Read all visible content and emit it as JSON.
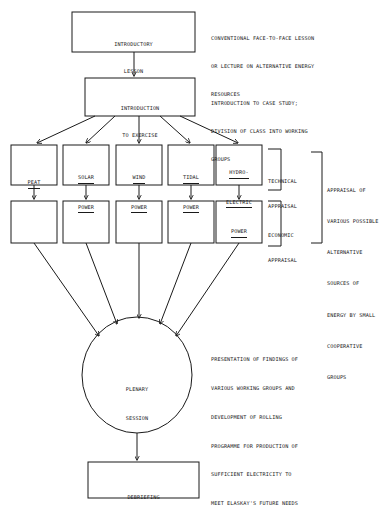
{
  "diagram": {
    "stroke_color": "#1a1a1a",
    "background_color": "#ffffff"
  },
  "nodes": {
    "introductory_lesson": {
      "shape": "rectangle",
      "lines": [
        "INTRODUCTORY",
        "LESSON"
      ]
    },
    "introduction_to_exercise": {
      "shape": "rectangle",
      "lines": [
        "INTRODUCTION",
        "TO EXERCISE"
      ]
    },
    "plenary_session": {
      "shape": "ellipse",
      "lines": [
        "PLENARY",
        "SESSION"
      ]
    },
    "debriefing": {
      "shape": "rectangle",
      "lines": [
        "DEBRIEFING"
      ]
    }
  },
  "technical_row": {
    "underlined": true,
    "boxes": [
      {
        "id": "peat",
        "lines": [
          "PEAT"
        ]
      },
      {
        "id": "solar-power",
        "lines": [
          "SOLAR",
          "POWER"
        ]
      },
      {
        "id": "wind-power",
        "lines": [
          "WIND",
          "POWER"
        ]
      },
      {
        "id": "tidal-power",
        "lines": [
          "TIDAL",
          "POWER"
        ]
      },
      {
        "id": "hydro-electric-power",
        "lines": [
          "HYDRO-",
          "ELECTRIC",
          "POWER"
        ]
      }
    ]
  },
  "economic_row": {
    "boxes": [
      {
        "id": "peat-economic",
        "lines": []
      },
      {
        "id": "solar-power-economic",
        "lines": []
      },
      {
        "id": "wind-power-economic",
        "lines": []
      },
      {
        "id": "tidal-power-economic",
        "lines": []
      },
      {
        "id": "hydro-electric-power-economic",
        "lines": []
      }
    ]
  },
  "brackets": {
    "technical": {
      "lines": [
        "TECHNICAL",
        "APPRAISAL"
      ]
    },
    "economic": {
      "lines": [
        "ECONOMIC",
        "APPRAISAL"
      ]
    }
  },
  "annotations": {
    "introductory_lesson": [
      "CONVENTIONAL FACE-TO-FACE LESSON",
      "OR LECTURE ON ALTERNATIVE ENERGY",
      "RESOURCES"
    ],
    "introduction_to_exercise": [
      "INTRODUCTION TO CASE STUDY;",
      "DIVISION OF CLASS INTO WORKING",
      "GROUPS"
    ],
    "appraisal_group": [
      "APPRAISAL OF",
      "VARIOUS POSSIBLE",
      "ALTERNATIVE",
      "SOURCES OF",
      "ENERGY BY SMALL",
      "COOPERATIVE",
      "GROUPS"
    ],
    "plenary_session": [
      "PRESENTATION OF FINDINGS OF",
      "VARIOUS WORKING GROUPS AND",
      "DEVELOPMENT OF ROLLING",
      "PROGRAMME FOR PRODUCTION OF",
      "SUFFICIENT ELECTRICITY TO",
      "MEET ELASKAY'S FUTURE NEEDS"
    ]
  }
}
